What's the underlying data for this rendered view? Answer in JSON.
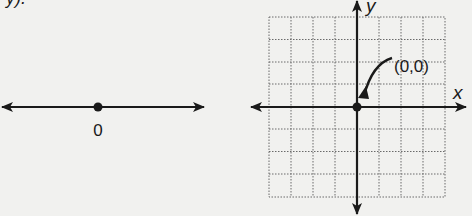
{
  "figure": {
    "top_fragment_text": "y).",
    "number_line": {
      "origin_label": "0"
    },
    "coordinate_plane": {
      "x_axis_label": "x",
      "y_axis_label": "y",
      "origin_annotation": "(0,0)",
      "grid_columns": 8,
      "grid_rows": 8
    }
  }
}
